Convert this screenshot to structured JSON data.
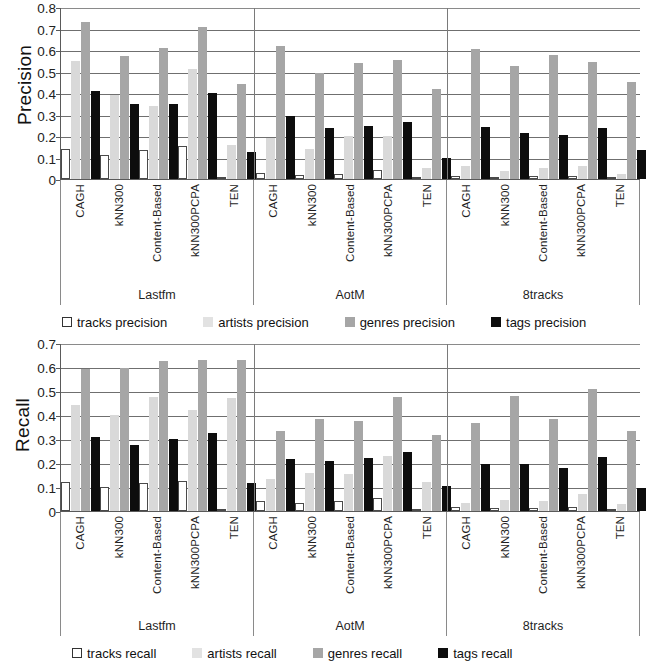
{
  "chart_data": [
    {
      "type": "bar",
      "title": "",
      "ylabel": "Precision",
      "xlabel": "",
      "ylim": [
        0,
        0.8
      ],
      "yticks": [
        "0.8",
        "0.7",
        "0.6",
        "0.5",
        "0.4",
        "0.3",
        "0.2",
        "0.1",
        "0"
      ],
      "ytick_values": [
        0.8,
        0.7,
        0.6,
        0.5,
        0.4,
        0.3,
        0.2,
        0.1,
        0
      ],
      "grid": true,
      "legend_position": "bottom",
      "group_labels": [
        "Lastfm",
        "AotM",
        "8tracks"
      ],
      "categories": [
        "CAGH",
        "kNN300",
        "Content-Based",
        "kNN300PCPA",
        "TEN"
      ],
      "series": [
        {
          "name": "tracks precision",
          "color": "#ffffff",
          "values": [
            [
              0.14,
              0.11,
              0.135,
              0.155,
              0.005
            ],
            [
              0.03,
              0.02,
              0.025,
              0.04,
              0.005
            ],
            [
              0.015,
              0.01,
              0.012,
              0.012,
              0.005
            ]
          ]
        },
        {
          "name": "artists precision",
          "color": "#d9d9d9",
          "values": [
            [
              0.55,
              0.39,
              0.34,
              0.51,
              0.16
            ],
            [
              0.19,
              0.14,
              0.2,
              0.2,
              0.05
            ],
            [
              0.06,
              0.035,
              0.05,
              0.06,
              0.025
            ]
          ]
        },
        {
          "name": "genres precision",
          "color": "#a6a6a6",
          "values": [
            [
              0.73,
              0.57,
              0.61,
              0.705,
              0.44
            ],
            [
              0.62,
              0.495,
              0.54,
              0.555,
              0.42
            ],
            [
              0.605,
              0.525,
              0.575,
              0.545,
              0.45
            ]
          ]
        },
        {
          "name": "tags precision",
          "color": "#0d0d0d",
          "values": [
            [
              0.41,
              0.35,
              0.35,
              0.4,
              0.125
            ],
            [
              0.295,
              0.235,
              0.245,
              0.265,
              0.1
            ],
            [
              0.24,
              0.215,
              0.205,
              0.235,
              0.135
            ]
          ]
        }
      ]
    },
    {
      "type": "bar",
      "title": "",
      "ylabel": "Recall",
      "xlabel": "",
      "ylim": [
        0,
        0.7
      ],
      "yticks": [
        "0.7",
        "0.6",
        "0.5",
        "0.4",
        "0.3",
        "0.2",
        "0.1",
        "0"
      ],
      "ytick_values": [
        0.7,
        0.6,
        0.5,
        0.4,
        0.3,
        0.2,
        0.1,
        0
      ],
      "grid": true,
      "legend_position": "bottom",
      "group_labels": [
        "Lastfm",
        "AotM",
        "8tracks"
      ],
      "categories": [
        "CAGH",
        "kNN300",
        "Content-Based",
        "kNN300PCPA",
        "TEN"
      ],
      "series": [
        {
          "name": "tracks recall",
          "color": "#ffffff",
          "values": [
            [
              0.12,
              0.1,
              0.115,
              0.125,
              0.005
            ],
            [
              0.04,
              0.035,
              0.04,
              0.055,
              0.005
            ],
            [
              0.015,
              0.012,
              0.012,
              0.015,
              0.005
            ]
          ]
        },
        {
          "name": "artists recall",
          "color": "#d9d9d9",
          "values": [
            [
              0.44,
              0.4,
              0.475,
              0.42,
              0.47
            ],
            [
              0.135,
              0.16,
              0.155,
              0.23,
              0.12
            ],
            [
              0.035,
              0.045,
              0.04,
              0.07,
              0.03
            ]
          ]
        },
        {
          "name": "genres recall",
          "color": "#a6a6a6",
          "values": [
            [
              0.59,
              0.595,
              0.625,
              0.63,
              0.63
            ],
            [
              0.335,
              0.385,
              0.375,
              0.475,
              0.315
            ],
            [
              0.365,
              0.48,
              0.385,
              0.51,
              0.335
            ]
          ]
        },
        {
          "name": "tags recall",
          "color": "#0d0d0d",
          "values": [
            [
              0.31,
              0.275,
              0.3,
              0.325,
              0.115
            ],
            [
              0.215,
              0.21,
              0.22,
              0.245,
              0.105
            ],
            [
              0.195,
              0.195,
              0.18,
              0.225,
              0.095
            ]
          ]
        }
      ]
    }
  ],
  "precision_chart": {
    "ylabel": "Precision",
    "yticks": [
      "0.8",
      "0.7",
      "0.6",
      "0.5",
      "0.4",
      "0.3",
      "0.2",
      "0.1",
      "0"
    ],
    "groups": [
      {
        "label": "Lastfm",
        "categories": [
          "CAGH",
          "kNN300",
          "Content-Based",
          "kNN300PCPA",
          "TEN"
        ]
      },
      {
        "label": "AotM",
        "categories": [
          "CAGH",
          "kNN300",
          "Content-Based",
          "kNN300PCPA",
          "TEN"
        ]
      },
      {
        "label": "8tracks",
        "categories": [
          "CAGH",
          "kNN300",
          "Content-Based",
          "kNN300PCPA",
          "TEN"
        ]
      }
    ],
    "legend": [
      {
        "label": "tracks precision",
        "key": "tracks"
      },
      {
        "label": "artists precision",
        "key": "artists"
      },
      {
        "label": "genres precision",
        "key": "genres"
      },
      {
        "label": "tags precision",
        "key": "tags"
      }
    ]
  },
  "recall_chart": {
    "ylabel": "Recall",
    "yticks": [
      "0.7",
      "0.6",
      "0.5",
      "0.4",
      "0.3",
      "0.2",
      "0.1",
      "0"
    ],
    "groups": [
      {
        "label": "Lastfm",
        "categories": [
          "CAGH",
          "kNN300",
          "Content-Based",
          "kNN300PCPA",
          "TEN"
        ]
      },
      {
        "label": "AotM",
        "categories": [
          "CAGH",
          "kNN300",
          "Content-Based",
          "kNN300PCPA",
          "TEN"
        ]
      },
      {
        "label": "8tracks",
        "categories": [
          "CAGH",
          "kNN300",
          "Content-Based",
          "kNN300PCPA",
          "TEN"
        ]
      }
    ],
    "legend": [
      {
        "label": "tracks recall",
        "key": "tracks"
      },
      {
        "label": "artists recall",
        "key": "artists"
      },
      {
        "label": "genres recall",
        "key": "genres"
      },
      {
        "label": "tags recall",
        "key": "tags"
      }
    ]
  },
  "colors": {
    "tracks": "#ffffff",
    "artists": "#d9d9d9",
    "genres": "#a6a6a6",
    "tags": "#0d0d0d",
    "axis": "#5a5a5a",
    "grid": "#6f6f6f"
  }
}
